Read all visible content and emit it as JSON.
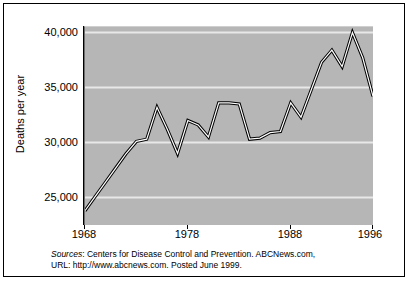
{
  "figure": {
    "y_axis_title": "Deaths per year"
  },
  "axes": {
    "y_ticks": [
      "40,000",
      "35,000",
      "30,000",
      "25,000"
    ],
    "x_ticks": [
      "1968",
      "1978",
      "1988",
      "1996"
    ]
  },
  "source": {
    "label": "Sources",
    "line1": ": Centers for Disease Control and Prevention. ABCNews.com,",
    "line2": "URL: http://www.abcnews.com. Posted June 1999."
  },
  "colors": {
    "plot_background": "#b6b6b6",
    "gridline": "#e8e8e8",
    "line_stroke": "#000000",
    "line_fill": "#ffffff",
    "frame": "#000000"
  },
  "chart_data": {
    "type": "line",
    "title": "",
    "xlabel": "",
    "ylabel": "Deaths per year",
    "xlim": [
      1968,
      1996
    ],
    "ylim": [
      22500,
      40500
    ],
    "grid": "horizontal",
    "legend": "none",
    "ytick_values": [
      40000,
      35000,
      30000,
      25000
    ],
    "xtick_values": [
      1968,
      1978,
      1988,
      1996
    ],
    "x": [
      1968,
      1969,
      1970,
      1971,
      1972,
      1973,
      1974,
      1975,
      1976,
      1977,
      1978,
      1979,
      1980,
      1981,
      1982,
      1983,
      1984,
      1985,
      1986,
      1987,
      1988,
      1989,
      1990,
      1991,
      1992,
      1993,
      1994,
      1995,
      1996
    ],
    "values": [
      23800,
      25100,
      26400,
      27700,
      29000,
      30100,
      30300,
      33200,
      31200,
      29000,
      32000,
      31600,
      30500,
      33600,
      33600,
      33500,
      30300,
      30400,
      30900,
      31000,
      33600,
      32300,
      34800,
      37300,
      38400,
      36900,
      40000,
      37700,
      34200
    ],
    "series": [
      {
        "name": "Deaths per year",
        "values": [
          23800,
          25100,
          26400,
          27700,
          29000,
          30100,
          30300,
          33200,
          31200,
          29000,
          32000,
          31600,
          30500,
          33600,
          33600,
          33500,
          30300,
          30400,
          30900,
          31000,
          33600,
          32300,
          34800,
          37300,
          38400,
          36900,
          40000,
          37700,
          34200
        ]
      }
    ]
  }
}
